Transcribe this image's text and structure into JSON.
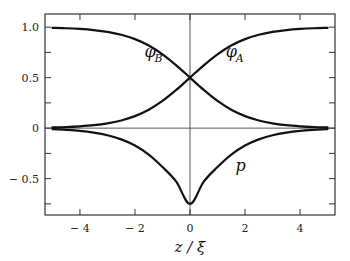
{
  "chart_data": {
    "type": "line",
    "title": "",
    "xlabel": "z / ξ",
    "ylabel": "",
    "xlim": [
      -5.27,
      5.27
    ],
    "ylim": [
      -0.86,
      1.13
    ],
    "grid": false,
    "reference_lines": {
      "x": 0,
      "y": 0
    },
    "x_ticks": [
      -4,
      -2,
      0,
      2,
      4
    ],
    "x_tick_labels": [
      "− 4",
      "− 2",
      "0",
      "2",
      "4"
    ],
    "y_ticks": [
      1.0,
      0.5,
      0,
      -0.5
    ],
    "y_tick_labels": [
      "1.0",
      "0.5",
      "0",
      "− 0.5"
    ],
    "y_minor_ticks": [
      0.75,
      0.25,
      -0.25,
      -0.75
    ],
    "x_minor_ticks": [],
    "series": [
      {
        "name": "phi_A",
        "label_main": "φ",
        "label_sub": "A",
        "label_at": [
          1.3,
          0.7
        ],
        "x": [
          -5,
          -4.5,
          -4,
          -3.5,
          -3,
          -2.5,
          -2,
          -1.5,
          -1,
          -0.5,
          0,
          0.5,
          1,
          1.5,
          2,
          2.5,
          3,
          3.5,
          4,
          4.5,
          5
        ],
        "y": [
          0.007,
          0.011,
          0.018,
          0.029,
          0.047,
          0.076,
          0.119,
          0.182,
          0.269,
          0.378,
          0.5,
          0.622,
          0.731,
          0.818,
          0.881,
          0.924,
          0.953,
          0.971,
          0.982,
          0.989,
          0.993
        ]
      },
      {
        "name": "phi_B",
        "label_main": "φ",
        "label_sub": "B",
        "label_at": [
          -1.65,
          0.7
        ],
        "x": [
          -5,
          -4.5,
          -4,
          -3.5,
          -3,
          -2.5,
          -2,
          -1.5,
          -1,
          -0.5,
          0,
          0.5,
          1,
          1.5,
          2,
          2.5,
          3,
          3.5,
          4,
          4.5,
          5
        ],
        "y": [
          0.993,
          0.989,
          0.982,
          0.971,
          0.953,
          0.924,
          0.881,
          0.818,
          0.731,
          0.622,
          0.5,
          0.378,
          0.269,
          0.182,
          0.119,
          0.076,
          0.047,
          0.029,
          0.018,
          0.011,
          0.007
        ]
      },
      {
        "name": "p",
        "label_main": "p",
        "label_sub": "",
        "label_at": [
          1.65,
          -0.42
        ],
        "x": [
          -5,
          -4.5,
          -4,
          -3.5,
          -3,
          -2.5,
          -2,
          -1.5,
          -1,
          -0.5,
          0,
          0.5,
          1,
          1.5,
          2,
          2.5,
          3,
          3.5,
          4,
          4.5,
          5
        ],
        "y": [
          -0.01,
          -0.017,
          -0.027,
          -0.044,
          -0.07,
          -0.111,
          -0.172,
          -0.262,
          -0.385,
          -0.53,
          -0.75,
          -0.53,
          -0.385,
          -0.262,
          -0.172,
          -0.111,
          -0.07,
          -0.044,
          -0.027,
          -0.017,
          -0.01
        ]
      }
    ]
  },
  "colors": {
    "line": "#111111",
    "frame": "#333333",
    "refline": "#444444"
  }
}
